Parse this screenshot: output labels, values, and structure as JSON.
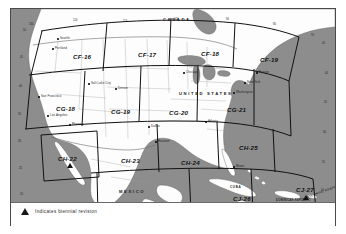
{
  "document": {
    "title": "Aeronautical Chart Index Map",
    "legend": {
      "symbol": "triangle-marker",
      "text": "Indicates biennial revision"
    }
  },
  "countries": [
    {
      "name": "CANADA",
      "x": 152,
      "y": 8,
      "kind": "land"
    },
    {
      "name": "UNITED STATES",
      "x": 168,
      "y": 82,
      "kind": "land"
    },
    {
      "name": "MEXICO",
      "x": 108,
      "y": 180,
      "kind": "land"
    },
    {
      "name": "CUBA",
      "x": 219,
      "y": 176,
      "kind": "land"
    },
    {
      "name": "JAMAICA",
      "x": 228,
      "y": 197,
      "kind": "land"
    },
    {
      "name": "DOMINICAN REPUBLIC",
      "y": 190,
      "x": 281,
      "kind": "land"
    },
    {
      "name": "ATLANTIC OCEAN",
      "x": 305,
      "y": 186,
      "kind": "sea"
    }
  ],
  "grid": {
    "rows": [
      {
        "row_id": "CF",
        "cells": [
          {
            "id": "CF-16",
            "x": 62,
            "y": 44,
            "revision": false
          },
          {
            "id": "CF-17",
            "x": 127,
            "y": 42,
            "revision": false
          },
          {
            "id": "CF-18",
            "x": 190,
            "y": 41,
            "revision": false
          },
          {
            "id": "CF-19",
            "x": 249,
            "y": 47,
            "revision": false
          }
        ]
      },
      {
        "row_id": "CG",
        "cells": [
          {
            "id": "CG-18",
            "x": 45,
            "y": 96,
            "revision": false
          },
          {
            "id": "CG-19",
            "x": 100,
            "y": 99,
            "revision": false
          },
          {
            "id": "CG-20",
            "x": 158,
            "y": 100,
            "revision": false
          },
          {
            "id": "CG-21",
            "x": 216,
            "y": 97,
            "revision": false
          }
        ]
      },
      {
        "row_id": "CH",
        "cells": [
          {
            "id": "CH-22",
            "x": 56,
            "y": 146,
            "revision": true
          },
          {
            "id": "CH-23",
            "x": 117,
            "y": 148,
            "revision": false
          },
          {
            "id": "CH-24",
            "x": 176,
            "y": 150,
            "revision": false
          },
          {
            "id": "CH-25",
            "x": 231,
            "y": 139,
            "revision": false
          }
        ]
      },
      {
        "row_id": "CJ",
        "cells": [
          {
            "id": "CJ-26",
            "x": 228,
            "y": 188,
            "revision": true
          },
          {
            "id": "CJ-27",
            "x": 290,
            "y": 179,
            "revision": true
          }
        ]
      }
    ]
  },
  "cities": [
    {
      "name": "Seattle",
      "x": 48,
      "y": 28
    },
    {
      "name": "Portland",
      "x": 43,
      "y": 38
    },
    {
      "name": "San Francisco",
      "x": 30,
      "y": 86
    },
    {
      "name": "Los Angeles",
      "x": 38,
      "y": 105
    },
    {
      "name": "Salt Lake City",
      "x": 79,
      "y": 73
    },
    {
      "name": "Denver",
      "x": 106,
      "y": 78
    },
    {
      "name": "Phoenix",
      "x": 60,
      "y": 114
    },
    {
      "name": "Dallas",
      "x": 139,
      "y": 116
    },
    {
      "name": "Houston",
      "x": 146,
      "y": 131
    },
    {
      "name": "Chicago",
      "x": 174,
      "y": 62
    },
    {
      "name": "Atlanta",
      "x": 196,
      "y": 111
    },
    {
      "name": "Miami",
      "x": 224,
      "y": 156
    },
    {
      "name": "New York",
      "x": 235,
      "y": 72
    },
    {
      "name": "Boston",
      "x": 247,
      "y": 62
    },
    {
      "name": "Washington",
      "x": 224,
      "y": 82
    }
  ],
  "ticks": [
    {
      "label": "130",
      "x": 18,
      "y": 14
    },
    {
      "label": "120",
      "x": 62,
      "y": 10
    },
    {
      "label": "110",
      "x": 112,
      "y": 11
    },
    {
      "label": "100",
      "x": 163,
      "y": 9
    },
    {
      "label": "90",
      "x": 215,
      "y": 9
    },
    {
      "label": "80",
      "x": 262,
      "y": 14
    },
    {
      "label": "70",
      "x": 300,
      "y": 25
    },
    {
      "label": "50",
      "x": 12,
      "y": 20
    },
    {
      "label": "45",
      "x": 9,
      "y": 47
    },
    {
      "label": "40",
      "x": 8,
      "y": 76
    },
    {
      "label": "35",
      "x": 7,
      "y": 104
    },
    {
      "label": "30",
      "x": 7,
      "y": 131
    },
    {
      "label": "25",
      "x": 8,
      "y": 158
    },
    {
      "label": "20",
      "x": 9,
      "y": 184
    },
    {
      "label": "45",
      "x": 311,
      "y": 33
    },
    {
      "label": "40",
      "x": 314,
      "y": 63
    },
    {
      "label": "35",
      "x": 313,
      "y": 92
    },
    {
      "label": "30",
      "x": 312,
      "y": 122
    },
    {
      "label": "25",
      "x": 311,
      "y": 152
    },
    {
      "label": "20",
      "x": 310,
      "y": 180
    }
  ],
  "colors": {
    "water": "#8d8d8d",
    "land": "#fdfdfd",
    "grid_line": "#111111",
    "border_line": "#3a3a3a",
    "frame": "#4a4a4a"
  }
}
